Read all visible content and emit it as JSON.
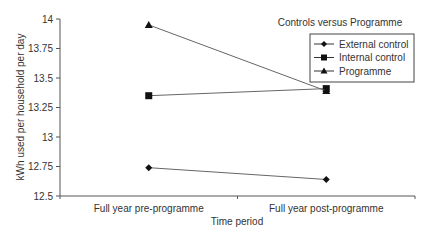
{
  "chart_data": {
    "type": "line",
    "title": "",
    "xlabel": "Time period",
    "ylabel": "kWh used per household per day",
    "categories": [
      "Full year pre-programme",
      "Full year post-programme"
    ],
    "ylim": [
      12.5,
      14
    ],
    "yticks": [
      "12.5",
      "12.75",
      "13",
      "13.25",
      "13.5",
      "13.75",
      "14"
    ],
    "legend_title": "Controls versus Programme",
    "legend_position": "top-right",
    "series": [
      {
        "name": "External control",
        "marker": "diamond",
        "values": [
          12.74,
          12.64
        ]
      },
      {
        "name": "Internal control",
        "marker": "square",
        "values": [
          13.35,
          13.41
        ]
      },
      {
        "name": "Programme",
        "marker": "triangle",
        "values": [
          13.95,
          13.39
        ]
      }
    ]
  }
}
